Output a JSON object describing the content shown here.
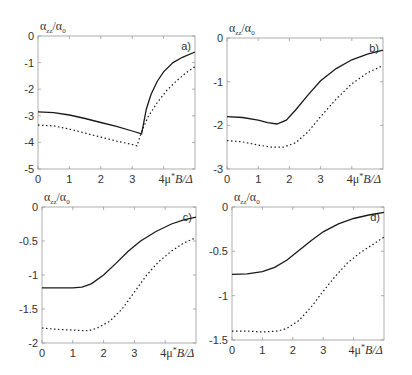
{
  "figure": {
    "y_label_main": "α",
    "y_label_sub": "zz",
    "y_label_den": "/α",
    "y_label_den_sub": "0",
    "x_label": "4μ*B/Δ",
    "x_label_parts": {
      "pre": "4μ",
      "sup": "*",
      "post": "B/Δ"
    }
  },
  "chart_data": [
    {
      "type": "line",
      "panel_label": "a)",
      "xlabel": "4μ*B/Δ",
      "ylabel": "α_zz/α_0",
      "xlim": [
        0,
        5
      ],
      "ylim": [
        -5,
        0
      ],
      "xticks": [
        "0",
        "1",
        "2",
        "3",
        "4"
      ],
      "yticks": [
        "0",
        "-1",
        "-2",
        "-3",
        "-4",
        "-5"
      ],
      "frame": {
        "left": 38,
        "top": 36,
        "right": 195,
        "bottom": 169
      },
      "series": [
        {
          "name": "solid",
          "style": "solid",
          "x": [
            0,
            0.5,
            1,
            1.5,
            2,
            2.5,
            3,
            3.3,
            3.45,
            3.6,
            3.8,
            4.0,
            4.3,
            4.6,
            5.0
          ],
          "y": [
            -2.85,
            -2.88,
            -2.97,
            -3.1,
            -3.25,
            -3.4,
            -3.57,
            -3.68,
            -2.75,
            -2.2,
            -1.7,
            -1.35,
            -1.0,
            -0.8,
            -0.6
          ]
        },
        {
          "name": "dotted",
          "style": "dotted",
          "x": [
            0,
            0.5,
            1,
            1.5,
            2,
            2.5,
            3,
            3.15,
            3.3,
            3.5,
            3.8,
            4.1,
            4.4,
            4.7,
            5.0
          ],
          "y": [
            -3.35,
            -3.38,
            -3.5,
            -3.65,
            -3.8,
            -3.95,
            -4.08,
            -4.13,
            -3.6,
            -3.05,
            -2.5,
            -2.05,
            -1.7,
            -1.4,
            -1.15
          ]
        }
      ]
    },
    {
      "type": "line",
      "panel_label": "b)",
      "xlabel": "4μ*B/Δ",
      "ylabel": "α_zz/α_0",
      "xlim": [
        0,
        5
      ],
      "ylim": [
        -3,
        0
      ],
      "xticks": [
        "0",
        "1",
        "2",
        "3",
        "4"
      ],
      "yticks": [
        "0",
        "-1",
        "-2",
        "-3"
      ],
      "frame": {
        "left": 227,
        "top": 38,
        "right": 383,
        "bottom": 169
      },
      "series": [
        {
          "name": "solid",
          "style": "solid",
          "x": [
            0,
            0.5,
            1,
            1.3,
            1.6,
            1.9,
            2.2,
            2.6,
            3.0,
            3.5,
            4.0,
            4.5,
            5.0
          ],
          "y": [
            -1.8,
            -1.82,
            -1.88,
            -1.94,
            -1.97,
            -1.88,
            -1.65,
            -1.3,
            -0.98,
            -0.7,
            -0.5,
            -0.37,
            -0.28
          ]
        },
        {
          "name": "dotted",
          "style": "dotted",
          "x": [
            0,
            0.5,
            1,
            1.4,
            1.8,
            2.2,
            2.6,
            3.0,
            3.5,
            4.0,
            4.5,
            5.0
          ],
          "y": [
            -2.35,
            -2.38,
            -2.45,
            -2.5,
            -2.5,
            -2.4,
            -2.15,
            -1.8,
            -1.4,
            -1.05,
            -0.8,
            -0.63
          ]
        }
      ]
    },
    {
      "type": "line",
      "panel_label": "c)",
      "xlabel": "4μ*B/Δ",
      "ylabel": "α_zz/α_0",
      "xlim": [
        0,
        5
      ],
      "ylim": [
        -2,
        0
      ],
      "xticks": [
        "0",
        "1",
        "2",
        "3",
        "4"
      ],
      "yticks": [
        "0",
        "-0.5",
        "-1",
        "-1.5",
        "-2"
      ],
      "frame": {
        "left": 42,
        "top": 207,
        "right": 196,
        "bottom": 343
      },
      "series": [
        {
          "name": "solid",
          "style": "solid",
          "x": [
            0,
            0.5,
            1,
            1.3,
            1.6,
            2.0,
            2.4,
            2.8,
            3.2,
            3.7,
            4.2,
            4.6,
            5.0
          ],
          "y": [
            -1.19,
            -1.19,
            -1.19,
            -1.18,
            -1.13,
            -1.0,
            -0.83,
            -0.65,
            -0.5,
            -0.36,
            -0.25,
            -0.19,
            -0.15
          ]
        },
        {
          "name": "dotted",
          "style": "dotted",
          "x": [
            0,
            0.5,
            1,
            1.5,
            1.8,
            2.2,
            2.6,
            3.0,
            3.4,
            3.8,
            4.2,
            4.6,
            5.0
          ],
          "y": [
            -1.78,
            -1.8,
            -1.81,
            -1.82,
            -1.78,
            -1.68,
            -1.5,
            -1.25,
            -1.0,
            -0.8,
            -0.65,
            -0.53,
            -0.45
          ]
        }
      ]
    },
    {
      "type": "line",
      "panel_label": "d)",
      "xlabel": "4μ*B/Δ",
      "ylabel": "α_zz/α_0",
      "xlim": [
        0,
        5
      ],
      "ylim": [
        -1.5,
        0
      ],
      "xticks": [
        "0",
        "1",
        "2",
        "3",
        "4"
      ],
      "yticks": [
        "0",
        "-0.5",
        "-1",
        "-1.5"
      ],
      "frame": {
        "left": 232,
        "top": 207,
        "right": 384,
        "bottom": 340
      },
      "series": [
        {
          "name": "solid",
          "style": "solid",
          "x": [
            0,
            0.5,
            1,
            1.4,
            1.8,
            2.2,
            2.6,
            3.0,
            3.5,
            4.0,
            4.5,
            5.0
          ],
          "y": [
            -0.76,
            -0.755,
            -0.73,
            -0.68,
            -0.6,
            -0.49,
            -0.38,
            -0.28,
            -0.19,
            -0.13,
            -0.09,
            -0.06
          ]
        },
        {
          "name": "dotted",
          "style": "dotted",
          "x": [
            0,
            0.5,
            1,
            1.5,
            1.8,
            2.2,
            2.6,
            3.0,
            3.4,
            3.8,
            4.2,
            4.6,
            5.0
          ],
          "y": [
            -1.4,
            -1.4,
            -1.41,
            -1.4,
            -1.37,
            -1.28,
            -1.13,
            -0.95,
            -0.78,
            -0.63,
            -0.52,
            -0.43,
            -0.34
          ]
        }
      ]
    }
  ]
}
